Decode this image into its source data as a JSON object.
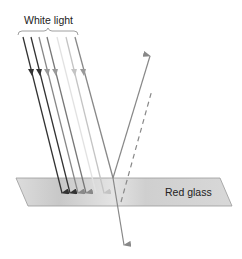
{
  "title_label": "White light",
  "glass_label": "Red glass",
  "colors": {
    "glass_fill": "#d6d6d6",
    "glass_stroke": "#9a9a9a",
    "ray_dark": "#333333",
    "ray_mid": "#777777",
    "ray_light": "#bbbbbb"
  }
}
